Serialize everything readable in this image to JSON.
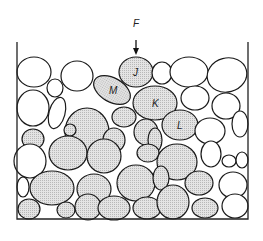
{
  "figure": {
    "type": "granular-packing-diagram",
    "force_label": "F",
    "labels": {
      "J": "J",
      "K": "K",
      "L": "L",
      "M": "M"
    },
    "colors": {
      "stroke": "#1a1a1a",
      "shaded": "#d9d9d9",
      "unshaded": "#ffffff",
      "wall": "#222222"
    }
  },
  "container": {
    "left_x": 17,
    "right_x": 248,
    "top_y": 42,
    "bottom_y": 219
  },
  "particles": [
    {
      "cx": 34,
      "cy": 72,
      "rx": 17,
      "ry": 15,
      "s": 0
    },
    {
      "cx": 77,
      "cy": 76,
      "rx": 16,
      "ry": 15,
      "s": 0
    },
    {
      "cx": 55,
      "cy": 88,
      "rx": 8,
      "ry": 9,
      "s": 0
    },
    {
      "cx": 112,
      "cy": 90,
      "rx": 20,
      "ry": 12,
      "s": 1,
      "r": 30,
      "label": "M"
    },
    {
      "cx": 136,
      "cy": 72,
      "rx": 17,
      "ry": 15,
      "s": 1,
      "label": "J"
    },
    {
      "cx": 162,
      "cy": 73,
      "rx": 10,
      "ry": 11,
      "s": 0
    },
    {
      "cx": 189,
      "cy": 72,
      "rx": 19,
      "ry": 15,
      "s": 0
    },
    {
      "cx": 227,
      "cy": 75,
      "rx": 20,
      "ry": 17,
      "s": 0,
      "r": -15
    },
    {
      "cx": 33,
      "cy": 108,
      "rx": 16,
      "ry": 18,
      "s": 0
    },
    {
      "cx": 57,
      "cy": 113,
      "rx": 8,
      "ry": 16,
      "s": 0,
      "r": 15
    },
    {
      "cx": 87,
      "cy": 132,
      "rx": 22,
      "ry": 24,
      "s": 1
    },
    {
      "cx": 155,
      "cy": 103,
      "rx": 22,
      "ry": 17,
      "s": 1,
      "label": "K"
    },
    {
      "cx": 124,
      "cy": 117,
      "rx": 12,
      "ry": 10,
      "s": 1
    },
    {
      "cx": 195,
      "cy": 98,
      "rx": 14,
      "ry": 12,
      "s": 0
    },
    {
      "cx": 226,
      "cy": 106,
      "rx": 14,
      "ry": 13,
      "s": 0
    },
    {
      "cx": 180,
      "cy": 125,
      "rx": 18,
      "ry": 15,
      "s": 1,
      "label": "L"
    },
    {
      "cx": 210,
      "cy": 131,
      "rx": 15,
      "ry": 13,
      "s": 0
    },
    {
      "cx": 240,
      "cy": 124,
      "rx": 8,
      "ry": 13,
      "s": 0
    },
    {
      "cx": 33,
      "cy": 139,
      "rx": 11,
      "ry": 10,
      "s": 1
    },
    {
      "cx": 70,
      "cy": 130,
      "rx": 6,
      "ry": 6,
      "s": 1
    },
    {
      "cx": 114,
      "cy": 140,
      "rx": 11,
      "ry": 12,
      "s": 1
    },
    {
      "cx": 146,
      "cy": 132,
      "rx": 12,
      "ry": 13,
      "s": 1
    },
    {
      "cx": 155,
      "cy": 140,
      "rx": 7,
      "ry": 12,
      "s": 1
    },
    {
      "cx": 30,
      "cy": 161,
      "rx": 16,
      "ry": 17,
      "s": 0
    },
    {
      "cx": 68,
      "cy": 153,
      "rx": 19,
      "ry": 17,
      "s": 1
    },
    {
      "cx": 104,
      "cy": 156,
      "rx": 17,
      "ry": 17,
      "s": 1
    },
    {
      "cx": 148,
      "cy": 153,
      "rx": 11,
      "ry": 9,
      "s": 1
    },
    {
      "cx": 177,
      "cy": 162,
      "rx": 20,
      "ry": 18,
      "s": 1
    },
    {
      "cx": 211,
      "cy": 154,
      "rx": 10,
      "ry": 13,
      "s": 0
    },
    {
      "cx": 229,
      "cy": 161,
      "rx": 7,
      "ry": 6,
      "s": 0
    },
    {
      "cx": 242,
      "cy": 160,
      "rx": 6,
      "ry": 8,
      "s": 0
    },
    {
      "cx": 23,
      "cy": 187,
      "rx": 6,
      "ry": 10,
      "s": 0
    },
    {
      "cx": 52,
      "cy": 188,
      "rx": 22,
      "ry": 17,
      "s": 1
    },
    {
      "cx": 94,
      "cy": 189,
      "rx": 17,
      "ry": 15,
      "s": 1
    },
    {
      "cx": 136,
      "cy": 183,
      "rx": 19,
      "ry": 18,
      "s": 1
    },
    {
      "cx": 161,
      "cy": 178,
      "rx": 8,
      "ry": 12,
      "s": 1
    },
    {
      "cx": 199,
      "cy": 183,
      "rx": 14,
      "ry": 12,
      "s": 1
    },
    {
      "cx": 233,
      "cy": 185,
      "rx": 14,
      "ry": 13,
      "s": 0
    },
    {
      "cx": 29,
      "cy": 209,
      "rx": 11,
      "ry": 10,
      "s": 1
    },
    {
      "cx": 66,
      "cy": 210,
      "rx": 9,
      "ry": 8,
      "s": 1
    },
    {
      "cx": 88,
      "cy": 207,
      "rx": 13,
      "ry": 13,
      "s": 1
    },
    {
      "cx": 114,
      "cy": 208,
      "rx": 16,
      "ry": 12,
      "s": 1
    },
    {
      "cx": 147,
      "cy": 208,
      "rx": 14,
      "ry": 11,
      "s": 1
    },
    {
      "cx": 173,
      "cy": 202,
      "rx": 16,
      "ry": 17,
      "s": 1
    },
    {
      "cx": 205,
      "cy": 208,
      "rx": 13,
      "ry": 10,
      "s": 1
    },
    {
      "cx": 235,
      "cy": 206,
      "rx": 13,
      "ry": 12,
      "s": 0
    }
  ]
}
